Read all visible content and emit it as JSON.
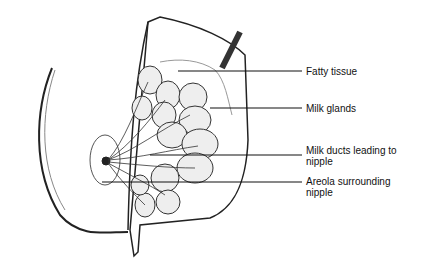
{
  "diagram": {
    "labels": [
      {
        "text": "Fatty tissue",
        "y": 66
      },
      {
        "text": "Milk glands",
        "y": 103
      },
      {
        "text": "Milk ducts leading to nipple",
        "y": 145
      },
      {
        "text": "Areola surrounding nipple",
        "y": 176
      }
    ]
  }
}
